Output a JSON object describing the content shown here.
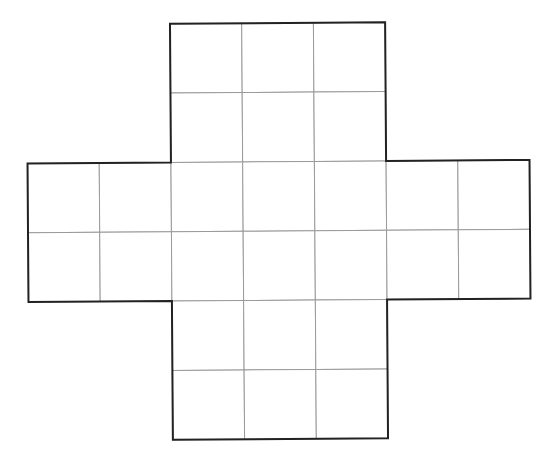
{
  "diagram": {
    "type": "cross-shaped grid",
    "cell_size": 72,
    "origin": {
      "x": 28,
      "y": 23
    },
    "rotation_deg": -0.4,
    "grid_columns": 7,
    "grid_rows": 6,
    "cells": [
      [
        2,
        0
      ],
      [
        3,
        0
      ],
      [
        4,
        0
      ],
      [
        2,
        1
      ],
      [
        3,
        1
      ],
      [
        4,
        1
      ],
      [
        0,
        2
      ],
      [
        1,
        2
      ],
      [
        2,
        2
      ],
      [
        3,
        2
      ],
      [
        4,
        2
      ],
      [
        5,
        2
      ],
      [
        6,
        2
      ],
      [
        0,
        3
      ],
      [
        1,
        3
      ],
      [
        2,
        3
      ],
      [
        3,
        3
      ],
      [
        4,
        3
      ],
      [
        5,
        3
      ],
      [
        6,
        3
      ],
      [
        2,
        4
      ],
      [
        3,
        4
      ],
      [
        4,
        4
      ],
      [
        2,
        5
      ],
      [
        3,
        5
      ],
      [
        4,
        5
      ]
    ],
    "outline": [
      [
        2,
        0
      ],
      [
        5,
        0
      ],
      [
        5,
        2
      ],
      [
        7,
        2
      ],
      [
        7,
        4
      ],
      [
        5,
        4
      ],
      [
        5,
        6
      ],
      [
        2,
        6
      ],
      [
        2,
        4
      ],
      [
        0,
        4
      ],
      [
        0,
        2
      ],
      [
        2,
        2
      ]
    ],
    "cell_count": 26,
    "colors": {
      "background": "#ffffff",
      "grid_line": "#9a9a9a",
      "outline": "#222222"
    }
  }
}
